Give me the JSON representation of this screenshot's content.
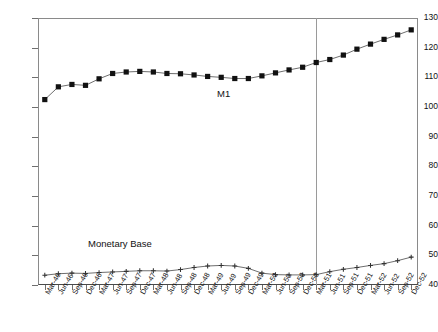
{
  "chart_data": {
    "type": "line",
    "title": "",
    "xlabel": "",
    "ylabel": "",
    "ylim": [
      40,
      130
    ],
    "ytick_step": 10,
    "yticks": [
      130,
      120,
      110,
      100,
      90,
      80,
      70,
      60,
      50,
      40
    ],
    "grid": false,
    "legend_position": "inline-annotation",
    "categories": [
      "Mar-46",
      "Jun-46",
      "Sep-46",
      "Dec-46",
      "Mar-47",
      "Jun-47",
      "Sep-47",
      "Dec-47",
      "Mar-48",
      "Jun-48",
      "Sep-48",
      "Dec-48",
      "Mar-49",
      "Jun-49",
      "Sep-49",
      "Dec-49",
      "Mar-50",
      "Jun-50",
      "Sep-50",
      "Dec-50",
      "Mar-51",
      "Jun-51",
      "Sep-51",
      "Dec-51",
      "Mar-52",
      "Jun-52",
      "Sep-52",
      "Dec-52"
    ],
    "series": [
      {
        "name": "M1",
        "marker": "filled-square",
        "values": [
          102.5,
          106.8,
          107.6,
          107.3,
          109.5,
          111.3,
          111.8,
          112.0,
          111.8,
          111.3,
          111.2,
          110.8,
          110.3,
          110.0,
          109.6,
          109.6,
          110.5,
          111.5,
          112.5,
          113.4,
          115.0,
          116.0,
          117.5,
          119.5,
          121.2,
          122.8,
          124.3,
          126.0
        ]
      },
      {
        "name": "Monetary Base",
        "marker": "plus",
        "values": [
          43.3,
          43.8,
          44.0,
          43.9,
          44.2,
          44.4,
          44.6,
          44.8,
          44.8,
          44.7,
          45.2,
          45.9,
          46.4,
          46.6,
          46.4,
          45.6,
          44.0,
          43.5,
          43.4,
          43.4,
          43.5,
          44.5,
          45.3,
          45.9,
          46.6,
          47.2,
          48.2,
          49.4
        ]
      }
    ],
    "annotations": [
      {
        "name": "m1-label",
        "text": "M1"
      },
      {
        "name": "monetary-base-label",
        "text": "Monetary Base"
      }
    ],
    "reference_lines": [
      {
        "name": "vertical-reference-mar-51",
        "at_category": "Mar-51",
        "orientation": "vertical"
      }
    ]
  },
  "caption": {
    "text": ""
  }
}
